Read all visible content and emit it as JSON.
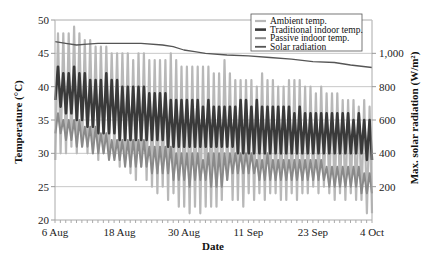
{
  "chart_data": {
    "type": "line",
    "title": "",
    "xlabel": "Date",
    "ylabel": "Temperature (°C)",
    "y2label": "Max. solar radiation (W/m²)",
    "ylim": [
      20,
      50
    ],
    "y2lim": [
      0,
      1200
    ],
    "yticks": [
      20,
      25,
      30,
      35,
      40,
      45,
      50
    ],
    "y2ticks": [
      200,
      400,
      600,
      800,
      1000
    ],
    "y2tick_labels": [
      "200",
      "400",
      "600",
      "800",
      "1,000"
    ],
    "xtick_labels": [
      "6 Aug",
      "18 Aug",
      "30 Aug",
      "11 Sep",
      "23 Sep",
      "4 Oct"
    ],
    "xtick_days": [
      0,
      12,
      24,
      36,
      48,
      59
    ],
    "num_days": 59,
    "grid": "horizontal",
    "legend_position": "upper right",
    "series": [
      {
        "name": "Ambient temp.",
        "axis": "left",
        "color": "#b8b8b8",
        "width": 2.2,
        "daily_max": [
          48,
          48,
          48,
          49,
          48,
          47,
          47,
          46,
          46,
          46,
          45,
          45,
          45,
          45,
          44,
          45,
          45,
          44,
          44,
          44,
          44,
          45,
          44,
          43,
          43,
          43,
          43,
          43,
          43,
          42,
          42,
          44,
          42,
          41,
          41,
          41,
          41,
          40,
          42,
          41,
          41,
          40,
          40,
          41,
          41,
          41,
          40,
          40,
          39,
          40,
          39,
          39,
          39,
          38,
          38,
          38,
          37,
          38,
          37
        ],
        "daily_min": [
          29,
          30,
          30,
          31,
          30,
          31,
          30,
          30,
          29,
          30,
          30,
          30,
          28,
          29,
          27,
          26,
          28,
          26,
          25,
          24,
          25,
          23,
          24,
          22,
          22,
          21,
          22,
          21,
          22,
          22,
          22,
          23,
          26,
          23,
          23,
          22,
          24,
          23,
          24,
          23,
          24,
          24,
          23,
          23,
          24,
          23,
          24,
          24,
          25,
          24,
          25,
          24,
          23,
          24,
          23,
          24,
          23,
          23,
          21
        ]
      },
      {
        "name": "Traditional indoor temp.",
        "axis": "left",
        "color": "#3a3a3a",
        "width": 2.6,
        "daily_max": [
          43,
          42,
          42,
          43,
          42,
          42,
          41,
          41,
          41,
          42,
          41,
          41,
          40,
          40,
          40,
          40,
          40,
          39,
          39,
          39,
          39,
          38,
          38,
          38,
          38,
          38,
          38,
          37,
          38,
          37,
          37,
          37,
          37,
          37,
          38,
          38,
          37,
          38,
          37,
          37,
          37,
          37,
          37,
          37,
          36,
          37,
          36,
          36,
          36,
          36,
          36,
          36,
          36,
          36,
          36,
          35,
          36,
          35,
          35
        ],
        "daily_min": [
          38,
          37,
          36,
          36,
          35,
          35,
          34,
          34,
          33,
          33,
          33,
          33,
          32,
          32,
          32,
          32,
          32,
          32,
          32,
          32,
          32,
          31,
          31,
          31,
          31,
          31,
          31,
          31,
          31,
          31,
          31,
          31,
          31,
          31,
          30,
          30,
          30,
          30,
          30,
          30,
          30,
          30,
          30,
          30,
          30,
          30,
          30,
          30,
          30,
          30,
          30,
          30,
          30,
          30,
          30,
          30,
          30,
          30,
          29
        ]
      },
      {
        "name": "Passive indoor temp.",
        "axis": "left",
        "color": "#8a8a8a",
        "width": 2.0,
        "daily_max": [
          36,
          35,
          35,
          35,
          35,
          34,
          34,
          34,
          33,
          33,
          32,
          32,
          32,
          32,
          32,
          32,
          32,
          31,
          31,
          31,
          31,
          31,
          30,
          30,
          30,
          30,
          30,
          29,
          30,
          30,
          30,
          30,
          30,
          30,
          30,
          30,
          30,
          29,
          29,
          30,
          29,
          29,
          29,
          29,
          29,
          29,
          29,
          29,
          29,
          29,
          28,
          28,
          28,
          28,
          28,
          28,
          28,
          27,
          27
        ],
        "daily_min": [
          33,
          33,
          32,
          32,
          31,
          31,
          31,
          30,
          30,
          30,
          29,
          29,
          29,
          28,
          28,
          28,
          28,
          28,
          27,
          27,
          27,
          27,
          26,
          26,
          26,
          25,
          26,
          26,
          26,
          25,
          25,
          25,
          26,
          27,
          27,
          27,
          27,
          27,
          26,
          26,
          26,
          26,
          26,
          26,
          26,
          26,
          26,
          26,
          26,
          26,
          26,
          25,
          25,
          25,
          25,
          25,
          25,
          24,
          24
        ]
      },
      {
        "name": "Solar radiation",
        "axis": "right",
        "color": "#555555",
        "width": 1.3,
        "points": [
          [
            0,
            1070
          ],
          [
            2,
            1060
          ],
          [
            4,
            1050
          ],
          [
            6,
            1055
          ],
          [
            8,
            1060
          ],
          [
            12,
            1060
          ],
          [
            16,
            1060
          ],
          [
            20,
            1050
          ],
          [
            22,
            1040
          ],
          [
            24,
            1020
          ],
          [
            26,
            1010
          ],
          [
            28,
            1000
          ],
          [
            32,
            990
          ],
          [
            36,
            985
          ],
          [
            40,
            975
          ],
          [
            44,
            965
          ],
          [
            48,
            950
          ],
          [
            52,
            945
          ],
          [
            55,
            930
          ],
          [
            59,
            915
          ]
        ]
      }
    ]
  },
  "layout": {
    "plot": {
      "left": 55,
      "top": 20,
      "right": 372,
      "bottom": 220
    }
  }
}
